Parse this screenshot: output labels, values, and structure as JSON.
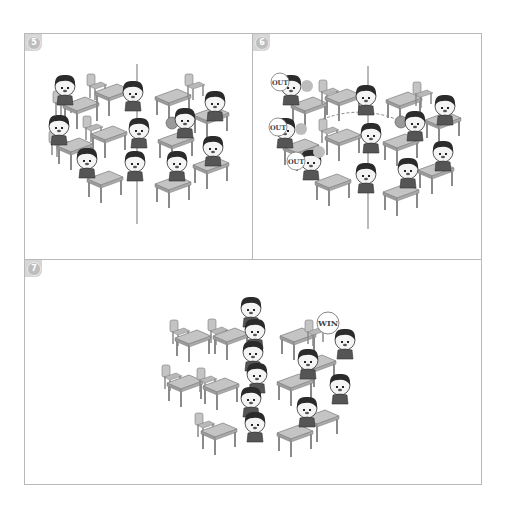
{
  "comic": {
    "panels": [
      {
        "number": "5",
        "description": "Classroom of students at desks arranged in two groups with a vertical line down the middle; three students sit along the center line.",
        "students": 10
      },
      {
        "number": "6",
        "description": "Ball thrown; three students on the left are eliminated, marked OUT, with dashed throw arrows.",
        "labels": [
          "OUT",
          "OUT",
          "OUT"
        ]
      },
      {
        "number": "7",
        "description": "Eliminated students line up along the center line; the right side is marked WIN.",
        "labels": [
          "WIN"
        ]
      }
    ]
  },
  "colors": {
    "border": "#b8b8b8",
    "desk": "#bdbdbd",
    "desk_dark": "#8e8e8e",
    "hair": "#2a2a2a",
    "skin": "#f2f2f2",
    "ball": "#9a9a9a",
    "badge": "#c4c4c4"
  }
}
